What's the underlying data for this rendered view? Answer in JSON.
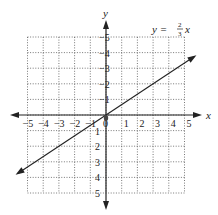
{
  "chart_data": {
    "type": "line",
    "title": "",
    "xlabel": "x",
    "ylabel": "y",
    "xlim": [
      -5,
      5
    ],
    "ylim": [
      -5,
      5
    ],
    "grid": true,
    "x_ticks": [
      -5,
      -4,
      -3,
      -2,
      -1,
      0,
      1,
      2,
      3,
      4,
      5
    ],
    "y_ticks": [
      -5,
      -4,
      -3,
      -2,
      -1,
      1,
      2,
      3,
      4,
      5
    ],
    "tick_labels": {
      "x": [
        "−5",
        "−4",
        "−3",
        "−2",
        "−1",
        "0",
        "1",
        "2",
        "3",
        "4",
        "5"
      ],
      "y": [
        "5",
        "4",
        "3",
        "2",
        "1",
        "−1",
        "−2",
        "−3",
        "−4",
        "−5"
      ]
    },
    "series": [
      {
        "name": "y = (2/3)x",
        "equation_prefix": "y = ",
        "fraction_numerator": "2",
        "fraction_denominator": "3",
        "equation_suffix": "x",
        "slope": 0.6667,
        "intercept": 0,
        "x": [
          -5.6,
          5.6
        ],
        "y": [
          -3.73,
          3.73
        ],
        "arrows": "both"
      }
    ],
    "points": [
      {
        "x": 0,
        "y": 0,
        "label": "origin"
      }
    ],
    "annotations": [
      {
        "text": "y = 2/3 x",
        "position": "top-right"
      }
    ]
  }
}
